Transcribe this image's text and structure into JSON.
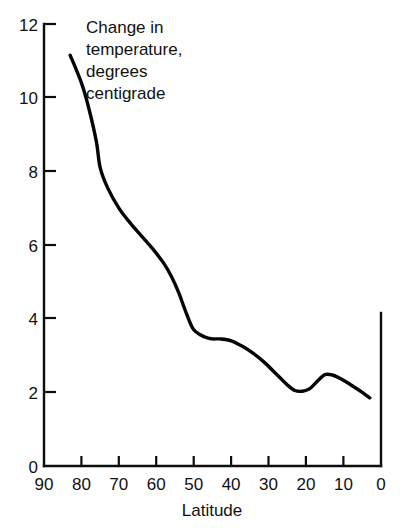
{
  "chart_data": {
    "type": "line",
    "title": "",
    "subtitle": "",
    "annotation": {
      "lines": [
        "Change in",
        "temperature,",
        "degrees",
        "centigrade"
      ],
      "full_text": "Change in temperature, degrees centigrade"
    },
    "xlabel": "Latitude",
    "ylabel": "",
    "ylabel_annotation": "Change in temperature, degrees centigrade",
    "xlim": [
      90,
      0
    ],
    "ylim": [
      0,
      12
    ],
    "x_ticks": [
      90,
      80,
      70,
      60,
      50,
      40,
      30,
      20,
      10,
      0
    ],
    "x_tick_labels": [
      "90",
      "80",
      "70",
      "60",
      "50",
      "40",
      "30",
      "20",
      "10",
      "0"
    ],
    "y_ticks": [
      0,
      2,
      4,
      6,
      8,
      10,
      12
    ],
    "y_tick_labels": [
      "0",
      "2",
      "4",
      "6",
      "8",
      "10",
      "12"
    ],
    "x_axis_direction": "descending",
    "grid": false,
    "legend": "none",
    "series": [
      {
        "name": "Change in temperature",
        "color": "#050505",
        "x": [
          83,
          80,
          78,
          76,
          75,
          73,
          70,
          67,
          64,
          61,
          58,
          56,
          54,
          52,
          50,
          47,
          45,
          43,
          40,
          37,
          34,
          31,
          28,
          25,
          23,
          21,
          19,
          17,
          15,
          13,
          11,
          8,
          5,
          3
        ],
        "values": [
          11.15,
          10.4,
          9.7,
          8.8,
          8.1,
          7.55,
          7.0,
          6.6,
          6.25,
          5.9,
          5.5,
          5.15,
          4.7,
          4.15,
          3.7,
          3.5,
          3.45,
          3.45,
          3.4,
          3.25,
          3.05,
          2.8,
          2.5,
          2.2,
          2.05,
          2.03,
          2.1,
          2.3,
          2.48,
          2.47,
          2.38,
          2.2,
          2.0,
          1.85
        ]
      }
    ]
  },
  "axes": {
    "y_axis_name": "y-axis",
    "x_axis_name": "x-axis",
    "right_spine_name": "right-spine"
  }
}
